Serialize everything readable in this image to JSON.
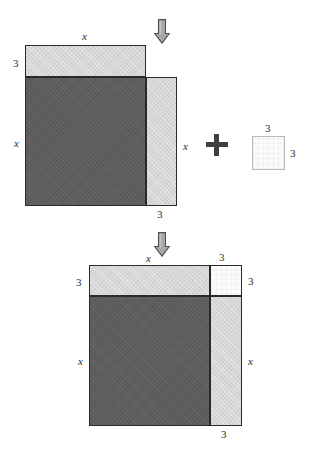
{
  "figure": {
    "colors": {
      "dark_fill": "#5d5d5d",
      "light_fill": "#d6d6d6",
      "white_fill": "#fbfbfb",
      "edge_dark": "#2a2a2a",
      "edge_light": "#b9b9b9",
      "arrow_fill": "#a8a8a8",
      "arrow_edge": "#4f4f4f",
      "plus_color": "#3f3f3f",
      "text_color": "#2b2b2b",
      "background": "#ffffff"
    },
    "operator": {
      "plus_symbol": "+"
    },
    "arrows": {
      "top": {
        "glyph": "down-arrow",
        "direction": "down"
      },
      "middle": {
        "glyph": "down-arrow",
        "direction": "down"
      }
    },
    "top_figure": {
      "name": "incomplete-square",
      "pieces": [
        {
          "id": "top-strip",
          "label": "3 by x",
          "fill": "light"
        },
        {
          "id": "main-square",
          "label": "x by x",
          "fill": "dark"
        },
        {
          "id": "right-strip",
          "label": "x by 3",
          "fill": "light"
        }
      ],
      "labels": {
        "top_width": "x",
        "left_strip_height": "3",
        "left_side": "x",
        "right_side": "x",
        "bottom_right_width": "3"
      }
    },
    "added_square": {
      "name": "missing-corner-square",
      "label": "3 by 3",
      "fill": "white",
      "labels": {
        "top": "3",
        "right": "3"
      }
    },
    "bottom_figure": {
      "name": "completed-square",
      "pieces": [
        {
          "id": "top-strip",
          "label": "3 by x",
          "fill": "light"
        },
        {
          "id": "corner-square",
          "label": "3 by 3",
          "fill": "white"
        },
        {
          "id": "main-square",
          "label": "x by x",
          "fill": "dark"
        },
        {
          "id": "right-strip",
          "label": "x by 3",
          "fill": "light"
        }
      ],
      "labels": {
        "top_width": "x",
        "top_right_width": "3",
        "left_strip_height": "3",
        "right_strip_height": "3",
        "left_side": "x",
        "right_side": "x",
        "bottom_right_width": "3"
      }
    }
  }
}
